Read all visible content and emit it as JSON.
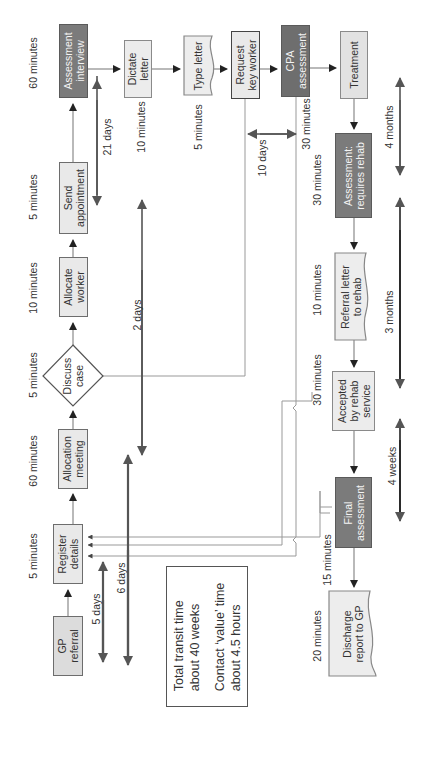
{
  "diagram": {
    "type": "process-flow",
    "orientation": "rotated-90-ccw",
    "colors": {
      "light_box": "#e9e9e9",
      "dark_box": "#7b7b7b",
      "line": "#888888",
      "arrow": "#222222",
      "duration_arrow": "#555555"
    },
    "steps": {
      "gp_referral": {
        "label": "GP\nreferral",
        "time": ""
      },
      "register_details": {
        "label": "Register\ndetails",
        "time": "5 minutes"
      },
      "allocation_meeting": {
        "label": "Allocation\nmeeting",
        "time": "60 minutes"
      },
      "discuss_case": {
        "label": "Discuss\ncase",
        "time": "5 minutes"
      },
      "allocate_worker": {
        "label": "Allocate\nworker",
        "time": "10 minutes"
      },
      "send_appointment": {
        "label": "Send\nappointment",
        "time": "5 minutes"
      },
      "assessment_interview": {
        "label": "Assessment\ninterview",
        "time": "60 minutes"
      },
      "dictate_letter": {
        "label": "Dictate\nletter",
        "time": "10 minutes"
      },
      "type_letter": {
        "label": "Type letter",
        "time": "5 minutes"
      },
      "request_key_worker": {
        "label": "Request\nkey worker",
        "time": ""
      },
      "cpa_assessment": {
        "label": "CPA\nassessment",
        "time": "30 minutes"
      },
      "treatment": {
        "label": "Treatment",
        "time": ""
      },
      "assessment_requires_rehab": {
        "label": "Assessment:\nrequires rehab",
        "time": "30 minutes"
      },
      "referral_letter_to_rehab": {
        "label": "Referral letter\nto rehab",
        "time": "10 minutes"
      },
      "accepted_by_rehab": {
        "label": "Accepted\nby rehab\nservice",
        "time": "30 minutes"
      },
      "final_assessment": {
        "label": "Final\nassessment",
        "time": "15 minutes"
      },
      "discharge_report": {
        "label": "Discharge\nreport to GP",
        "time": "20 minutes"
      }
    },
    "durations": {
      "d5_days": "5 days",
      "d6_days": "6 days",
      "d2_days": "2 days",
      "d21_days": "21 days",
      "d10_days": "10 days",
      "d4_months": "4 months",
      "d3_months": "3 months",
      "d4_weeks": "4 weeks"
    },
    "summary": {
      "line1": "Total transit time",
      "line2": "about 40 weeks",
      "line3": "Contact ‘value’ time",
      "line4": "about 4.5 hours"
    }
  }
}
